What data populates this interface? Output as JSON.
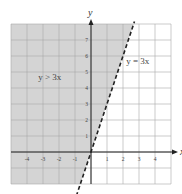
{
  "chart_data": {
    "type": "line",
    "title": "",
    "xlabel": "x",
    "ylabel": "y",
    "xlim": [
      -5,
      5
    ],
    "ylim": [
      -2,
      8
    ],
    "grid": true,
    "x_ticks": [
      "-4",
      "-3",
      "-2",
      "-1",
      "1",
      "2",
      "3",
      "4"
    ],
    "y_ticks": [
      "1",
      "2",
      "3",
      "4",
      "5",
      "6",
      "7"
    ],
    "series": [
      {
        "name": "y = 3x",
        "style": "dashed",
        "slope": 3,
        "intercept": 0
      }
    ],
    "shaded_region": {
      "label": "y > 3x",
      "side": "above-left of line",
      "color": "#d4d4d4"
    },
    "annotations": [
      {
        "text": "y > 3x",
        "x": -3.3,
        "y": 4.5
      },
      {
        "text": "y = 3x",
        "x": 2.2,
        "y": 5.5
      }
    ]
  },
  "colors": {
    "shade": "#d4d4d4",
    "grid": "#a8a8a8",
    "axis": "#222222",
    "line": "#222222"
  }
}
